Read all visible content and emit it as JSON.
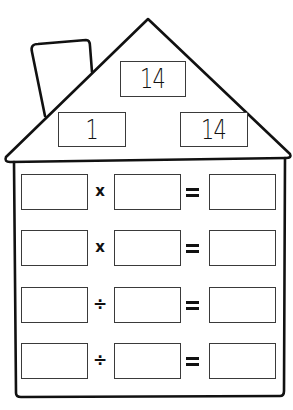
{
  "worksheet": {
    "type": "fact family house",
    "roof": {
      "top_number": "14",
      "left_number": "1",
      "right_number": "14"
    },
    "rows": [
      {
        "left": "",
        "operator": "x",
        "right": "",
        "equals": "=",
        "result": ""
      },
      {
        "left": "",
        "operator": "x",
        "right": "",
        "equals": "=",
        "result": ""
      },
      {
        "left": "",
        "operator": "÷",
        "right": "",
        "equals": "=",
        "result": ""
      },
      {
        "left": "",
        "operator": "÷",
        "right": "",
        "equals": "=",
        "result": ""
      }
    ]
  },
  "colors": {
    "line": "#111111",
    "box_border": "#3a3a3a",
    "background": "#ffffff"
  }
}
